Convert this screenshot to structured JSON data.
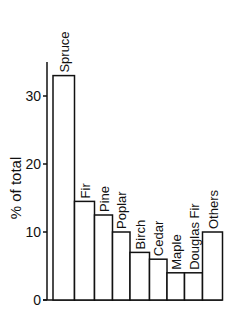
{
  "chart_data": {
    "type": "bar",
    "title": "",
    "xlabel": "",
    "ylabel": "% of total",
    "ylim": [
      0,
      35
    ],
    "yticks": [
      0,
      10,
      20,
      30
    ],
    "grid": false,
    "legend": null,
    "categories": [
      "Spruce",
      "Fir",
      "Pine",
      "Poplar",
      "Birch",
      "Cedar",
      "Maple",
      "Douglas Fir",
      "Others"
    ],
    "values": [
      33,
      14.5,
      12.5,
      10,
      7,
      6,
      4,
      4,
      10
    ],
    "label_orientation": "vertical, above each bar"
  },
  "colors": {
    "bar_fill": "#ffffff",
    "bar_stroke": "#111111",
    "axis": "#111111"
  }
}
